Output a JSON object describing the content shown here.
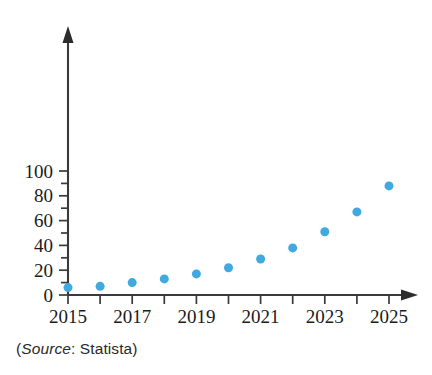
{
  "chart_data": {
    "type": "scatter",
    "title": "",
    "subtitle": "",
    "xlabel": "",
    "ylabel": "",
    "x": [
      2015,
      2016,
      2017,
      2018,
      2019,
      2020,
      2021,
      2022,
      2023,
      2024,
      2025
    ],
    "values": [
      6,
      7,
      10,
      13,
      17,
      22,
      29,
      38,
      51,
      67,
      88
    ],
    "series": [
      {
        "name": "",
        "values": [
          6,
          7,
          10,
          13,
          17,
          22,
          29,
          38,
          51,
          67,
          88
        ]
      }
    ],
    "xlim": [
      2015,
      2025
    ],
    "ylim": [
      0,
      105
    ],
    "x_tick_values": [
      2015,
      2016,
      2017,
      2018,
      2019,
      2020,
      2021,
      2022,
      2023,
      2024,
      2025
    ],
    "x_tick_labels": [
      "2015",
      "",
      "2017",
      "",
      "2019",
      "",
      "2021",
      "",
      "2023",
      "",
      "2025"
    ],
    "y_tick_values": [
      0,
      10,
      20,
      30,
      40,
      50,
      60,
      70,
      80,
      90,
      100
    ],
    "y_tick_labels": [
      "0",
      "",
      "20",
      "",
      "40",
      "",
      "60",
      "",
      "80",
      "",
      "100"
    ],
    "grid": false,
    "legend": false,
    "legend_position": "none",
    "marker_color": "#3fa9e0",
    "axis_color": "#3a3a3a",
    "marker_size": 9,
    "annotations": []
  },
  "caption": {
    "open_paren": "(",
    "source_word": "Source",
    "colon": ":",
    "source_name": " Statista",
    "close_paren": ")",
    "full_text": "(Source: Statista)"
  }
}
